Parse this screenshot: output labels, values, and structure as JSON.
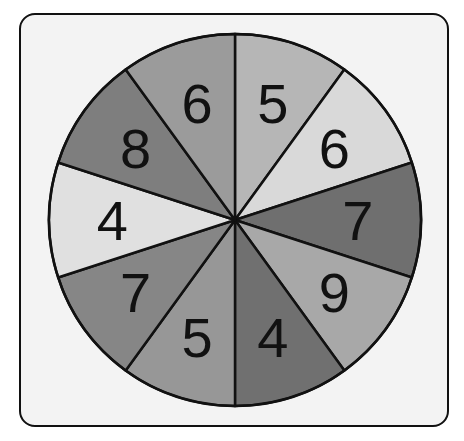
{
  "spinner": {
    "title": "Number spinner",
    "center": [
      235,
      220
    ],
    "radius": 186,
    "sections": [
      {
        "label": "5",
        "color": "#b6b6b6"
      },
      {
        "label": "6",
        "color": "#d9d9d9"
      },
      {
        "label": "7",
        "color": "#6f6f6f"
      },
      {
        "label": "9",
        "color": "#a8a8a8"
      },
      {
        "label": "4",
        "color": "#707070"
      },
      {
        "label": "5",
        "color": "#979797"
      },
      {
        "label": "7",
        "color": "#868686"
      },
      {
        "label": "4",
        "color": "#e0e0e0"
      },
      {
        "label": "8",
        "color": "#7e7e7e"
      },
      {
        "label": "6",
        "color": "#9b9b9b"
      }
    ]
  }
}
